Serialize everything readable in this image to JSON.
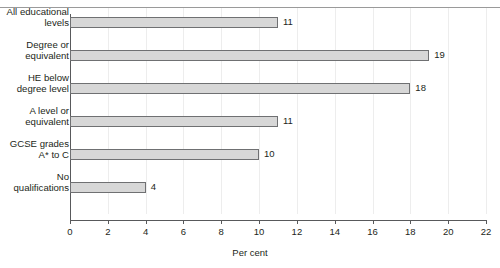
{
  "figure": {
    "title_clipped": "",
    "axis_x_label": "Per cent",
    "colors": {
      "bar_fill": "#d7d7d7",
      "bar_border": "#6f7072",
      "axis": "#58595b",
      "gridline": "#ededed",
      "text": "#231f20",
      "rule": "#9a9a9a"
    }
  },
  "chart_data": {
    "type": "bar",
    "orientation": "horizontal",
    "title": "",
    "xlabel": "Per cent",
    "ylabel": "",
    "xlim": [
      0,
      22
    ],
    "xticks": [
      0,
      2,
      4,
      6,
      8,
      10,
      12,
      14,
      16,
      18,
      20,
      22
    ],
    "xtick_labels": [
      "0",
      "2",
      "4",
      "6",
      "8",
      "10",
      "12",
      "14",
      "16",
      "18",
      "20",
      "22"
    ],
    "grid": "vertical-only",
    "legend": "none",
    "categories": [
      "All educational levels",
      "Degree or equivalent",
      "HE below degree level",
      "A level or equivalent",
      "GCSE grades A* to C",
      "No qualifications"
    ],
    "category_lines": [
      [
        "All educational",
        "levels"
      ],
      [
        "Degree or",
        "equivalent"
      ],
      [
        "HE below",
        "degree level"
      ],
      [
        "A level or",
        "equivalent"
      ],
      [
        "GCSE grades",
        "A* to C"
      ],
      [
        "No",
        "qualifications"
      ]
    ],
    "values": [
      11,
      19,
      18,
      11,
      10,
      4
    ],
    "data_labels": [
      "11",
      "19",
      "18",
      "11",
      "10",
      "4"
    ]
  }
}
